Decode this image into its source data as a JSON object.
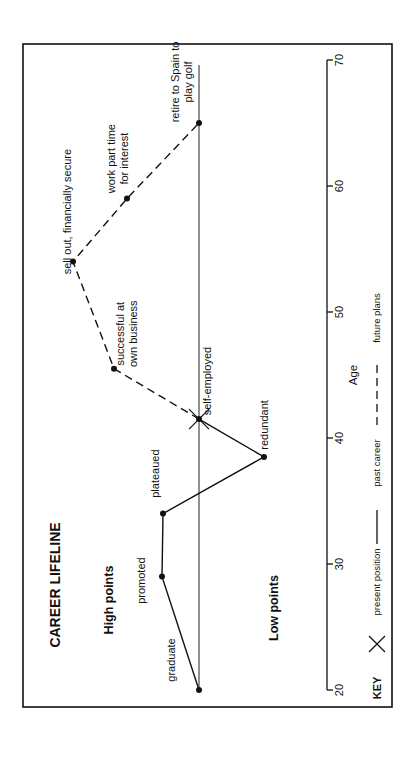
{
  "chart_data": {
    "type": "line",
    "title": "CAREER LIFELINE",
    "orientation": "rotated 90° counter-clockwise (age axis runs bottom to top)",
    "xlabel": "Age",
    "ylabel": "",
    "region_labels": {
      "high": "High points",
      "low": "Low points"
    },
    "x_ticks": [
      20,
      30,
      40,
      50,
      60,
      70
    ],
    "xlim": [
      20,
      70
    ],
    "grid": false,
    "baseline": 0,
    "series": [
      {
        "name": "past career",
        "style": "solid",
        "points": [
          {
            "age": 20,
            "level": 0,
            "label": "graduate"
          },
          {
            "age": 29,
            "level": 37,
            "label": "promoted"
          },
          {
            "age": 34,
            "level": 36,
            "label": "plateaued"
          },
          {
            "age": 38.5,
            "level": -65,
            "label": "redundant"
          },
          {
            "age": 41.5,
            "level": 0,
            "label": "self-employed"
          }
        ]
      },
      {
        "name": "future plans",
        "style": "dashed",
        "points": [
          {
            "age": 41.5,
            "level": 0,
            "label": "self-employed"
          },
          {
            "age": 45.5,
            "level": 85,
            "label": "successful at own business"
          },
          {
            "age": 54,
            "level": 126,
            "label": "sell out, financially secure"
          },
          {
            "age": 59,
            "level": 72,
            "label": "work part time for interest"
          },
          {
            "age": 65,
            "level": 0,
            "label": "retire to Spain to play golf"
          }
        ]
      }
    ],
    "present_position": {
      "age": 41.5,
      "level": 0,
      "marker": "X"
    },
    "legend": {
      "title": "KEY",
      "position": "bottom (rotated)",
      "items": [
        {
          "symbol": "X",
          "label": "present position"
        },
        {
          "symbol": "solid-line",
          "label": "past career"
        },
        {
          "symbol": "dashed-line",
          "label": "future plans"
        }
      ]
    }
  }
}
